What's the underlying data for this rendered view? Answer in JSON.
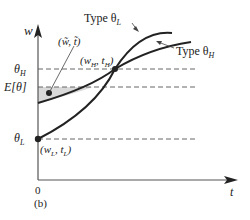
{
  "figure": {
    "panel_label": "(b)",
    "axes": {
      "y_label": "w",
      "x_label": "t",
      "origin_label": "0"
    },
    "levels": {
      "theta_H": "θ",
      "theta_H_sub": "H",
      "expected": "E[θ]",
      "theta_L": "θ",
      "theta_L_sub": "L"
    },
    "curves": [
      {
        "name": "Type θL",
        "label_main": "Type θ",
        "label_sub": "L"
      },
      {
        "name": "Type θH",
        "label_main": "Type θ",
        "label_sub": "H"
      }
    ],
    "points": {
      "pooling": {
        "label": "(w̃, t̃)"
      },
      "high": {
        "label_open": "(w",
        "sub1": "H",
        "mid": ", t",
        "sub2": "H",
        "close": ")"
      },
      "low": {
        "label_open": "(w",
        "sub1": "L",
        "mid": ", t",
        "sub2": "L",
        "close": ")"
      }
    },
    "colors": {
      "ink": "#222222",
      "axis": "#555555",
      "dash": "#666666",
      "shade": "#d9d9d9"
    }
  }
}
